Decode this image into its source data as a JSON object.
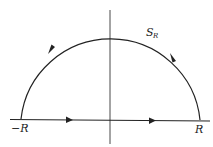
{
  "diagram": {
    "type": "contour",
    "labels": {
      "neg_R": "−R",
      "pos_R": "R",
      "arc_main": "S",
      "arc_sub": "R"
    },
    "colors": {
      "stroke": "#222222",
      "axis": "#333333",
      "background": "#ffffff"
    }
  }
}
